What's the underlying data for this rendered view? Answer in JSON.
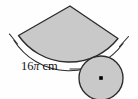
{
  "figure": {
    "type": "geometry-diagram",
    "background_color": "#fefefe",
    "sector": {
      "name": "shaded-sector",
      "fill_color": "#c9c9c9",
      "stroke_color": "#2b2b2b",
      "apex_point": [
        70,
        6
      ],
      "left_corner": [
        18,
        35
      ],
      "right_corner": [
        118,
        38
      ]
    },
    "circle": {
      "name": "shaded-circle",
      "fill_color": "#c9c9c9",
      "stroke_color": "#2b2b2b",
      "center": [
        101,
        78
      ],
      "radius": 22,
      "center_dot_color": "#000000"
    },
    "measurement": {
      "label_value": "16",
      "label_symbol": "π",
      "label_unit": "cm",
      "full_label": "16π cm",
      "tick_left_position": [
        13,
        40
      ],
      "tick_right_position": [
        124,
        43
      ],
      "leader_line_color": "#2b2b2b"
    }
  }
}
